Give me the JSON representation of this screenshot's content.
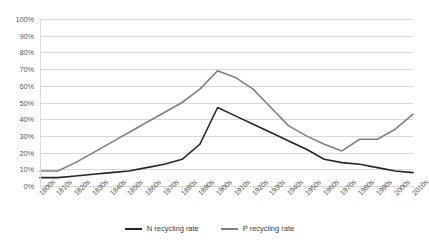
{
  "chart_data": {
    "type": "line",
    "title": "",
    "subtitle": "",
    "xlabel": "",
    "ylabel": "",
    "grid": true,
    "legend_position": "bottom",
    "ylim": [
      0,
      100
    ],
    "yticks": [
      0,
      10,
      20,
      30,
      40,
      50,
      60,
      70,
      80,
      90,
      100
    ],
    "ytick_labels": [
      "0%",
      "10%",
      "20%",
      "30%",
      "40%",
      "50%",
      "60%",
      "70%",
      "80%",
      "90%",
      "100%"
    ],
    "categories": [
      "1800s",
      "1810s",
      "1820s",
      "1830s",
      "1840s",
      "1850s",
      "1860s",
      "1870s",
      "1880s",
      "1890s",
      "1900s",
      "1910s",
      "1920s",
      "1930s",
      "1940s",
      "1950s",
      "1960s",
      "1970s",
      "1980s",
      "1990s",
      "2000s",
      "2010s"
    ],
    "series": [
      {
        "name": "N recycling rate",
        "color": "#262626",
        "values": [
          5,
          5,
          6,
          7,
          8,
          9,
          11,
          13,
          16,
          25,
          47,
          42,
          37,
          32,
          27,
          22,
          16,
          14,
          13,
          11,
          9,
          8
        ]
      },
      {
        "name": "P recycling rate",
        "color": "#808080",
        "values": [
          9,
          9,
          14,
          20,
          26,
          32,
          38,
          44,
          50,
          58,
          69,
          65,
          58,
          47,
          36,
          30,
          25,
          21,
          28,
          28,
          34,
          43
        ]
      }
    ]
  },
  "legend": {
    "items": [
      {
        "label": "N recycling rate",
        "color": "#262626"
      },
      {
        "label": "P recycling rate",
        "color": "#808080"
      }
    ]
  }
}
